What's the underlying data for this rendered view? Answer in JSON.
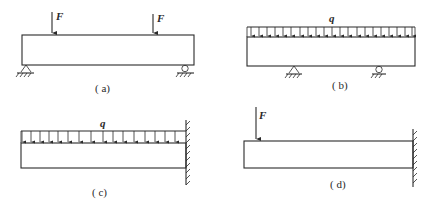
{
  "figure": {
    "panels": [
      {
        "id": "a",
        "label": "( a)",
        "type": "simply-supported beam, two point loads",
        "load_symbols": [
          "F",
          "F"
        ]
      },
      {
        "id": "b",
        "label": "( b)",
        "type": "overhanging beam, uniform distributed load",
        "load_symbol": "q"
      },
      {
        "id": "c",
        "label": "( c)",
        "type": "cantilever, uniform distributed load",
        "load_symbol": "q"
      },
      {
        "id": "d",
        "label": "( d)",
        "type": "cantilever, point load at free end",
        "load_symbol": "F"
      }
    ]
  }
}
